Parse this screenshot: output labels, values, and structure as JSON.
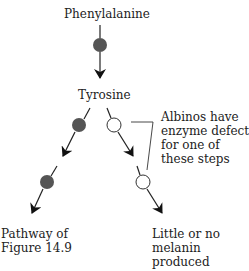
{
  "diagram": {
    "type": "metabolic-pathway",
    "nodes": {
      "phenylalanine": "Phenylalanine",
      "tyrosine": "Tyrosine"
    },
    "annotation": {
      "lines": [
        "Albinos have",
        "enzyme defect",
        "for one of",
        "these steps"
      ]
    },
    "outcomes": {
      "left": {
        "lines": [
          "Pathway of",
          "Figure 14.9"
        ]
      },
      "right": {
        "lines": [
          "Little or no",
          "melanin",
          "produced"
        ]
      }
    },
    "legend_colors": {
      "functional_enzyme": "#555555",
      "defective_enzyme": "#ffffff",
      "arrow": "#111111"
    }
  }
}
